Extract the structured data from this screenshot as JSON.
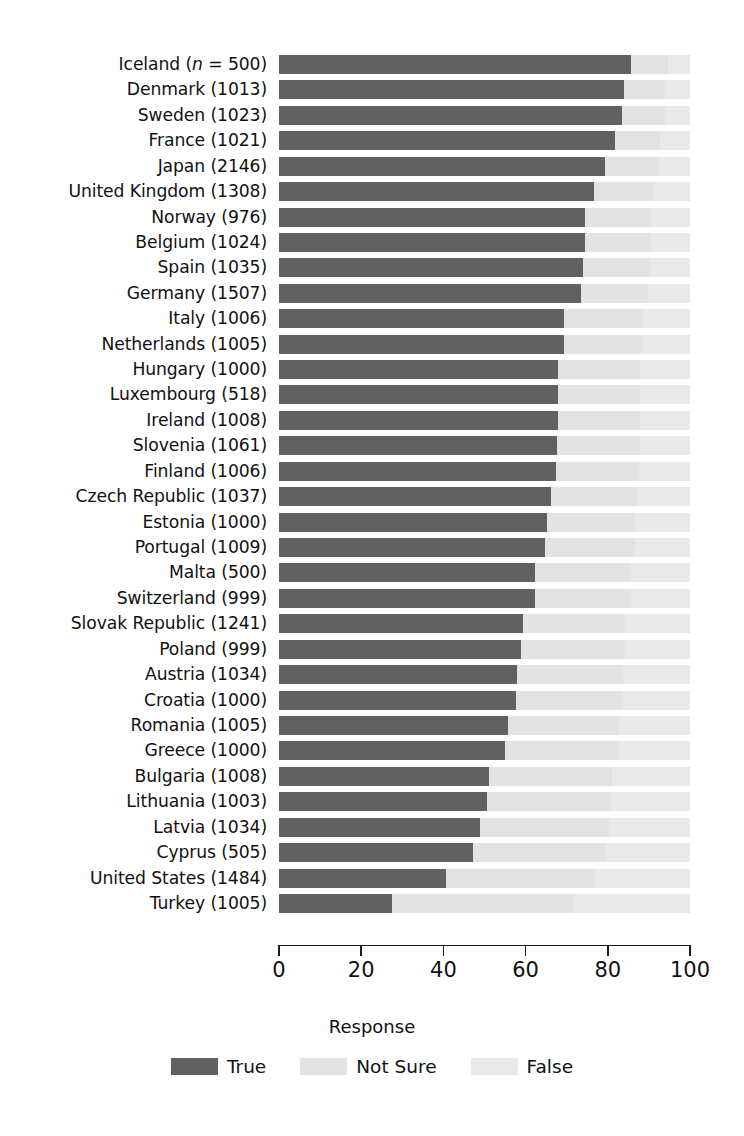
{
  "chart_data": {
    "type": "bar",
    "subtype": "stacked-horizontal-100pct",
    "title": "",
    "xlabel": "",
    "ylabel": "",
    "legend_title": "Response",
    "legend_position": "bottom-center",
    "grid": false,
    "xlim": [
      0,
      100
    ],
    "xticks": [
      0,
      20,
      40,
      60,
      80,
      100
    ],
    "xtick_labels": [
      "0",
      "20",
      "40",
      "60",
      "80",
      "100"
    ],
    "series": [
      {
        "name": "True",
        "color": "#616161"
      },
      {
        "name": "Not Sure",
        "color": "#e3e3e3"
      },
      {
        "name": "False",
        "color": "#e9e9e9"
      }
    ],
    "categories": [
      "Iceland (n = 500)",
      "Denmark (1013)",
      "Sweden (1023)",
      "France (1021)",
      "Japan (2146)",
      "United Kingdom (1308)",
      "Norway (976)",
      "Belgium (1024)",
      "Spain (1035)",
      "Germany (1507)",
      "Italy (1006)",
      "Netherlands (1005)",
      "Hungary (1000)",
      "Luxembourg (518)",
      "Ireland (1008)",
      "Slovenia (1061)",
      "Finland (1006)",
      "Czech Republic (1037)",
      "Estonia (1000)",
      "Portugal (1009)",
      "Malta (500)",
      "Switzerland (999)",
      "Slovak Republic (1241)",
      "Poland (999)",
      "Austria (1034)",
      "Croatia (1000)",
      "Romania (1005)",
      "Greece (1000)",
      "Bulgaria (1008)",
      "Lithuania (1003)",
      "Latvia (1034)",
      "Cyprus (505)",
      "United States (1484)",
      "Turkey (1005)"
    ],
    "rows": [
      {
        "country": "Iceland",
        "n": "500",
        "label": "Iceland (n = 500)",
        "italic_n": true,
        "true": 85.6,
        "not_sure": 9.0,
        "false": 5.4
      },
      {
        "country": "Denmark",
        "n": "1013",
        "label": "Denmark (1013)",
        "italic_n": false,
        "true": 83.9,
        "not_sure": 10.0,
        "false": 6.1
      },
      {
        "country": "Sweden",
        "n": "1023",
        "label": "Sweden (1023)",
        "italic_n": false,
        "true": 83.4,
        "not_sure": 10.4,
        "false": 6.2
      },
      {
        "country": "France",
        "n": "1021",
        "label": "France (1021)",
        "italic_n": false,
        "true": 81.7,
        "not_sure": 11.1,
        "false": 7.2
      },
      {
        "country": "Japan",
        "n": "2146",
        "label": "Japan (2146)",
        "italic_n": false,
        "true": 79.3,
        "not_sure": 13.0,
        "false": 7.7
      },
      {
        "country": "United Kingdom",
        "n": "1308",
        "label": "United Kingdom (1308)",
        "italic_n": false,
        "true": 76.6,
        "not_sure": 14.6,
        "false": 8.8
      },
      {
        "country": "Norway",
        "n": "976",
        "label": "Norway (976)",
        "italic_n": false,
        "true": 74.4,
        "not_sure": 16.0,
        "false": 9.6
      },
      {
        "country": "Belgium",
        "n": "1024",
        "label": "Belgium (1024)",
        "italic_n": false,
        "true": 74.4,
        "not_sure": 16.1,
        "false": 9.5
      },
      {
        "country": "Spain",
        "n": "1035",
        "label": "Spain (1035)",
        "italic_n": false,
        "true": 73.9,
        "not_sure": 16.3,
        "false": 9.8
      },
      {
        "country": "Germany",
        "n": "1507",
        "label": "Germany (1507)",
        "italic_n": false,
        "true": 73.4,
        "not_sure": 16.5,
        "false": 10.1
      },
      {
        "country": "Italy",
        "n": "1006",
        "label": "Italy (1006)",
        "italic_n": false,
        "true": 69.3,
        "not_sure": 19.0,
        "false": 11.7
      },
      {
        "country": "Netherlands",
        "n": "1005",
        "label": "Netherlands (1005)",
        "italic_n": false,
        "true": 69.3,
        "not_sure": 19.1,
        "false": 11.6
      },
      {
        "country": "Hungary",
        "n": "1000",
        "label": "Hungary (1000)",
        "italic_n": false,
        "true": 67.8,
        "not_sure": 20.0,
        "false": 12.2
      },
      {
        "country": "Luxembourg",
        "n": "518",
        "label": "Luxembourg (518)",
        "italic_n": false,
        "true": 68.0,
        "not_sure": 19.8,
        "false": 12.2
      },
      {
        "country": "Ireland",
        "n": "1008",
        "label": "Ireland (1008)",
        "italic_n": false,
        "true": 67.8,
        "not_sure": 20.1,
        "false": 12.1
      },
      {
        "country": "Slovenia",
        "n": "1061",
        "label": "Slovenia (1061)",
        "italic_n": false,
        "true": 67.6,
        "not_sure": 20.2,
        "false": 12.2
      },
      {
        "country": "Finland",
        "n": "1006",
        "label": "Finland (1006)",
        "italic_n": false,
        "true": 67.3,
        "not_sure": 20.4,
        "false": 12.3
      },
      {
        "country": "Czech Republic",
        "n": "1037",
        "label": "Czech Republic (1037)",
        "italic_n": false,
        "true": 66.1,
        "not_sure": 21.0,
        "false": 12.9
      },
      {
        "country": "Estonia",
        "n": "1000",
        "label": "Estonia (1000)",
        "italic_n": false,
        "true": 65.1,
        "not_sure": 21.6,
        "false": 13.3
      },
      {
        "country": "Portugal",
        "n": "1009",
        "label": "Portugal (1009)",
        "italic_n": false,
        "true": 64.6,
        "not_sure": 22.0,
        "false": 13.4
      },
      {
        "country": "Malta",
        "n": "500",
        "label": "Malta (500)",
        "italic_n": false,
        "true": 62.4,
        "not_sure": 23.3,
        "false": 14.3
      },
      {
        "country": "Switzerland",
        "n": "999",
        "label": "Switzerland (999)",
        "italic_n": false,
        "true": 62.2,
        "not_sure": 23.4,
        "false": 14.4
      },
      {
        "country": "Slovak Republic",
        "n": "1241",
        "label": "Slovak Republic (1241)",
        "italic_n": false,
        "true": 59.3,
        "not_sure": 25.0,
        "false": 15.7
      },
      {
        "country": "Poland",
        "n": "999",
        "label": "Poland (999)",
        "italic_n": false,
        "true": 58.8,
        "not_sure": 25.3,
        "false": 15.9
      },
      {
        "country": "Austria",
        "n": "1034",
        "label": "Austria (1034)",
        "italic_n": false,
        "true": 58.0,
        "not_sure": 25.8,
        "false": 16.2
      },
      {
        "country": "Croatia",
        "n": "1000",
        "label": "Croatia (1000)",
        "italic_n": false,
        "true": 57.6,
        "not_sure": 26.0,
        "false": 16.4
      },
      {
        "country": "Romania",
        "n": "1005",
        "label": "Romania (1005)",
        "italic_n": false,
        "true": 55.6,
        "not_sure": 27.2,
        "false": 17.2
      },
      {
        "country": "Greece",
        "n": "1000",
        "label": "Greece (1000)",
        "italic_n": false,
        "true": 54.9,
        "not_sure": 27.6,
        "false": 17.5
      },
      {
        "country": "Bulgaria",
        "n": "1008",
        "label": "Bulgaria (1008)",
        "italic_n": false,
        "true": 51.0,
        "not_sure": 30.0,
        "false": 19.0
      },
      {
        "country": "Lithuania",
        "n": "1003",
        "label": "Lithuania (1003)",
        "italic_n": false,
        "true": 50.7,
        "not_sure": 30.2,
        "false": 19.1
      },
      {
        "country": "Latvia",
        "n": "1034",
        "label": "Latvia (1034)",
        "italic_n": false,
        "true": 48.8,
        "not_sure": 31.4,
        "false": 19.8
      },
      {
        "country": "Cyprus",
        "n": "505",
        "label": "Cyprus (505)",
        "italic_n": false,
        "true": 47.1,
        "not_sure": 32.4,
        "false": 20.5
      },
      {
        "country": "United States",
        "n": "1484",
        "label": "United States (1484)",
        "italic_n": false,
        "true": 40.7,
        "not_sure": 36.3,
        "false": 23.0
      },
      {
        "country": "Turkey",
        "n": "1005",
        "label": "Turkey (1005)",
        "italic_n": false,
        "true": 27.6,
        "not_sure": 44.2,
        "false": 28.2
      }
    ]
  },
  "legend": {
    "title": "Response",
    "items": [
      {
        "label": "True",
        "color": "#616161"
      },
      {
        "label": "Not Sure",
        "color": "#e3e3e3"
      },
      {
        "label": "False",
        "color": "#e9e9e9"
      }
    ]
  },
  "axis": {
    "ticks": [
      "0",
      "20",
      "40",
      "60",
      "80",
      "100"
    ]
  }
}
